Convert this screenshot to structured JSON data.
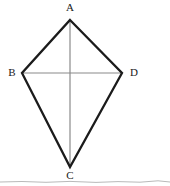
{
  "figure": {
    "shape_name": "kite",
    "vertices": [
      {
        "id": "A",
        "label": "A",
        "role": "top-apex",
        "x": 70,
        "y": 20
      },
      {
        "id": "B",
        "label": "B",
        "role": "left-vertex",
        "x": 22,
        "y": 73
      },
      {
        "id": "C",
        "label": "C",
        "role": "bottom-apex",
        "x": 70,
        "y": 167
      },
      {
        "id": "D",
        "label": "D",
        "role": "right-vertex",
        "x": 122,
        "y": 73
      }
    ],
    "outline": {
      "points": "70,20 122,73 70,167 22,73",
      "stroke_color": "#1b1b1b",
      "stroke_width": 2.3
    },
    "diagonals": [
      {
        "id": "AC",
        "from": "A",
        "to": "C",
        "orientation": "vertical",
        "x1": 70,
        "y1": 20,
        "x2": 70,
        "y2": 167,
        "stroke_color": "#8a8a8a",
        "stroke_width": 1.2
      },
      {
        "id": "BD",
        "from": "B",
        "to": "D",
        "orientation": "horizontal",
        "x1": 22,
        "y1": 73,
        "x2": 122,
        "y2": 73,
        "stroke_color": "#8a8a8a",
        "stroke_width": 1.2
      }
    ],
    "intersection": {
      "id": "O",
      "x": 70,
      "y": 73,
      "visible_label": ""
    },
    "background_color": "#ffffff"
  },
  "scan_edge": {
    "description": "faint scanned page edge line near bottom",
    "path": "M0,182 L22,181.5 L46,182.3 L70,181.4 L96,182.4 L118,181.6 L140,182.2 L158,180.8 L170,182",
    "stroke_color": "#b9b9b9",
    "stroke_width": 1
  }
}
